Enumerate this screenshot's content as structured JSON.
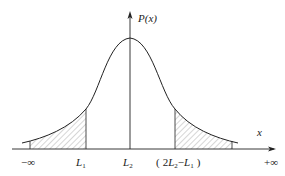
{
  "diagram": {
    "y_axis_label": "P(x)",
    "x_axis_label": "x",
    "x_ticks": [
      {
        "text": "−∞",
        "x": 30
      },
      {
        "text": "L1",
        "x": 86
      },
      {
        "text": "L2",
        "x": 130
      },
      {
        "text": "(2L2−L1)",
        "x": 175
      },
      {
        "text": "+∞",
        "x": 272
      }
    ],
    "curve": "normal distribution density, symmetric about L2",
    "shaded_regions": [
      "left tail from −∞ to L1",
      "right tail from (2L2−L1) to +∞"
    ],
    "colors": {
      "line": "#222222",
      "hatch": "#777777",
      "background": "#ffffff"
    }
  }
}
